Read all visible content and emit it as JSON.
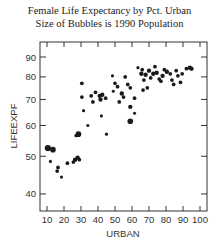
{
  "chart_data": {
    "type": "scatter",
    "title": "Female Life  Expectancy by Pct. Urban",
    "subtitle": "Size of Bubbles is 1990 Population",
    "xlabel": "URBAN",
    "ylabel": "LIFEEXPF",
    "xlim": [
      5,
      105
    ],
    "ylim": [
      35,
      100
    ],
    "yscale": "log",
    "xticks": [
      10,
      20,
      30,
      40,
      50,
      60,
      70,
      80,
      90,
      100
    ],
    "yticks": [
      40,
      50,
      60,
      70,
      80,
      90
    ],
    "grid": false,
    "legend": null,
    "marker_color": "#1a1a1a",
    "points": [
      {
        "x": 10.5,
        "y": 52.5,
        "size": 5
      },
      {
        "x": 13.5,
        "y": 52,
        "size": 4.5
      },
      {
        "x": 12,
        "y": 48.5,
        "size": 2.5
      },
      {
        "x": 16.5,
        "y": 46.8,
        "size": 3
      },
      {
        "x": 16,
        "y": 45.8,
        "size": 3
      },
      {
        "x": 18.5,
        "y": 44.2,
        "size": 2.5
      },
      {
        "x": 22,
        "y": 48,
        "size": 3
      },
      {
        "x": 25.5,
        "y": 48.3,
        "size": 3
      },
      {
        "x": 26.5,
        "y": 49,
        "size": 3.5
      },
      {
        "x": 28,
        "y": 49.6,
        "size": 3.5
      },
      {
        "x": 29,
        "y": 49,
        "size": 3
      },
      {
        "x": 27,
        "y": 56.5,
        "size": 2.5
      },
      {
        "x": 28.5,
        "y": 57,
        "size": 4.5
      },
      {
        "x": 30.5,
        "y": 77,
        "size": 3
      },
      {
        "x": 30.5,
        "y": 71,
        "size": 3
      },
      {
        "x": 31.5,
        "y": 65.5,
        "size": 2.5
      },
      {
        "x": 34,
        "y": 60,
        "size": 2.5
      },
      {
        "x": 36,
        "y": 71.5,
        "size": 3
      },
      {
        "x": 37,
        "y": 69,
        "size": 3
      },
      {
        "x": 38.5,
        "y": 73,
        "size": 3
      },
      {
        "x": 41,
        "y": 71.5,
        "size": 3.5
      },
      {
        "x": 41.5,
        "y": 70,
        "size": 3.5
      },
      {
        "x": 42,
        "y": 63.5,
        "size": 2.5
      },
      {
        "x": 42.5,
        "y": 72,
        "size": 3.5
      },
      {
        "x": 44.5,
        "y": 70.5,
        "size": 3
      },
      {
        "x": 45,
        "y": 57,
        "size": 2.5
      },
      {
        "x": 48.5,
        "y": 80.5,
        "size": 2.5
      },
      {
        "x": 49,
        "y": 73.5,
        "size": 2.5
      },
      {
        "x": 50,
        "y": 77,
        "size": 3
      },
      {
        "x": 51.5,
        "y": 75.5,
        "size": 3
      },
      {
        "x": 52.5,
        "y": 69,
        "size": 3
      },
      {
        "x": 54,
        "y": 72.5,
        "size": 3.5
      },
      {
        "x": 55,
        "y": 71,
        "size": 3
      },
      {
        "x": 56,
        "y": 80,
        "size": 3
      },
      {
        "x": 57.5,
        "y": 76.5,
        "size": 3
      },
      {
        "x": 59,
        "y": 75,
        "size": 3
      },
      {
        "x": 59,
        "y": 67,
        "size": 3.5
      },
      {
        "x": 59,
        "y": 61.5,
        "size": 4.5
      },
      {
        "x": 61.5,
        "y": 70.5,
        "size": 3
      },
      {
        "x": 61.5,
        "y": 64.5,
        "size": 2.5
      },
      {
        "x": 63.5,
        "y": 84.5,
        "size": 2.5
      },
      {
        "x": 65.5,
        "y": 81.5,
        "size": 3.5
      },
      {
        "x": 66,
        "y": 83.5,
        "size": 3
      },
      {
        "x": 66.5,
        "y": 74,
        "size": 3
      },
      {
        "x": 67,
        "y": 78.5,
        "size": 3
      },
      {
        "x": 68,
        "y": 81,
        "size": 3.5
      },
      {
        "x": 69,
        "y": 75,
        "size": 3
      },
      {
        "x": 70,
        "y": 83,
        "size": 3.5
      },
      {
        "x": 71,
        "y": 79.5,
        "size": 3
      },
      {
        "x": 72.5,
        "y": 81.5,
        "size": 3.5
      },
      {
        "x": 73.5,
        "y": 85,
        "size": 3
      },
      {
        "x": 74.5,
        "y": 82,
        "size": 3.5
      },
      {
        "x": 76,
        "y": 79,
        "size": 3
      },
      {
        "x": 77,
        "y": 78,
        "size": 3
      },
      {
        "x": 78,
        "y": 80.5,
        "size": 3.5
      },
      {
        "x": 79,
        "y": 83.5,
        "size": 3
      },
      {
        "x": 80.5,
        "y": 82.5,
        "size": 3.5
      },
      {
        "x": 82.5,
        "y": 81.5,
        "size": 3
      },
      {
        "x": 83.5,
        "y": 78.5,
        "size": 3
      },
      {
        "x": 84.5,
        "y": 76.5,
        "size": 3
      },
      {
        "x": 86,
        "y": 83,
        "size": 3
      },
      {
        "x": 87,
        "y": 80.5,
        "size": 3
      },
      {
        "x": 88.5,
        "y": 77.5,
        "size": 3
      },
      {
        "x": 89.5,
        "y": 81.5,
        "size": 3
      },
      {
        "x": 92,
        "y": 84,
        "size": 3
      },
      {
        "x": 94,
        "y": 84.5,
        "size": 3.5
      },
      {
        "x": 95,
        "y": 84,
        "size": 3.5
      }
    ]
  }
}
